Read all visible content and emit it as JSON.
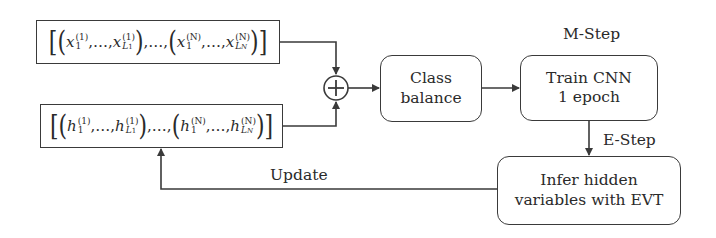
{
  "diagram": {
    "type": "flowchart",
    "nodes": {
      "x_sequences": {
        "kind": "input",
        "text": "[(x_1^(1),…,x_{L_1}^(1)),…,(x_1^(N),…,x_{L_N}^(N))]",
        "var": "x",
        "first_sup": "(1)",
        "last_sup": "(N)",
        "sub_first": "1",
        "sub_L1": "L",
        "sub_L1_idx": "1",
        "sub_LN": "L",
        "sub_LN_idx": "N",
        "ellipsis": "…",
        "comma": ","
      },
      "h_sequences": {
        "kind": "input",
        "text": "[(h_1^(1),…,h_{L_1}^(1)),…,(h_1^(N),…,h_{L_N}^(N))]",
        "var": "h",
        "first_sup": "(1)",
        "last_sup": "(N)",
        "sub_first": "1",
        "sub_L1": "L",
        "sub_L1_idx": "1",
        "sub_LN": "L",
        "sub_LN_idx": "N",
        "ellipsis": "…",
        "comma": ","
      },
      "concat": {
        "kind": "operator",
        "symbol": "⊕",
        "icon": "circle-plus-icon"
      },
      "class_balance": {
        "kind": "process",
        "line1": "Class",
        "line2": "balance"
      },
      "train_cnn": {
        "kind": "process",
        "line1": "Train CNN",
        "line2": "1 epoch"
      },
      "infer_hidden": {
        "kind": "process",
        "line1": "Infer hidden",
        "line2": "variables with EVT"
      }
    },
    "labels": {
      "m_step": "M-Step",
      "e_step": "E-Step",
      "update": "Update"
    },
    "edges": [
      {
        "from": "x_sequences",
        "to": "concat"
      },
      {
        "from": "h_sequences",
        "to": "concat"
      },
      {
        "from": "concat",
        "to": "class_balance"
      },
      {
        "from": "class_balance",
        "to": "train_cnn"
      },
      {
        "from": "train_cnn",
        "to": "infer_hidden",
        "label": "E-Step"
      },
      {
        "from": "infer_hidden",
        "to": "h_sequences",
        "label": "Update"
      }
    ],
    "colors": {
      "stroke": "#3a3a3a",
      "text": "#2a2a2a",
      "background": "#ffffff"
    }
  }
}
